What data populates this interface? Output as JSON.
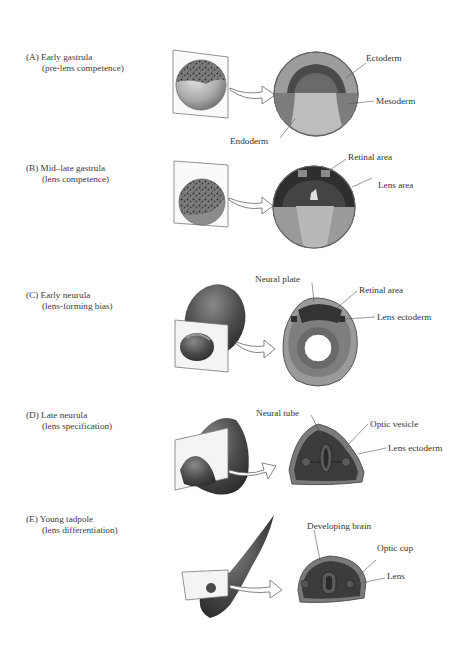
{
  "figure": {
    "panels": [
      {
        "id": "A",
        "stage": "(A) Early gastrula",
        "phase": "(pre-lens competence)",
        "callouts": [
          "Ectoderm",
          "Mesoderm",
          "Endoderm"
        ]
      },
      {
        "id": "B",
        "stage": "(B) Mid–late gastrula",
        "phase": "(lens competence)",
        "callouts": [
          "Retinal area",
          "Lens area"
        ]
      },
      {
        "id": "C",
        "stage": "(C) Early neurula",
        "phase": "(lens-forming bias)",
        "callouts": [
          "Neural plate",
          "Retinal area",
          "Lens ectoderm"
        ]
      },
      {
        "id": "D",
        "stage": "(D) Late neurula",
        "phase": "(lens specification)",
        "callouts": [
          "Neural tube",
          "Optic vesicle",
          "Lens ectoderm"
        ]
      },
      {
        "id": "E",
        "stage": "(E) Young tadpole",
        "phase": "(lens differentiation)",
        "callouts": [
          "Developing brain",
          "Optic cup",
          "Lens"
        ]
      }
    ],
    "colors": {
      "dark_tissue": "#3c3c3c",
      "mid_tissue": "#6e6e6e",
      "light_tissue": "#a8a8a8",
      "pale_tissue": "#c9c9c9",
      "outline": "#555555"
    }
  }
}
